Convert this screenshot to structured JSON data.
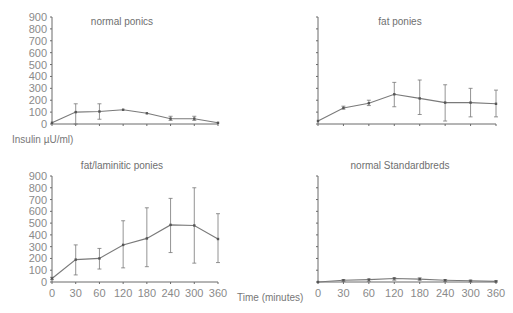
{
  "figure": {
    "ylabel": "Insulin µU/ml)",
    "xlabel": "Time (minutes)"
  },
  "chart_data": [
    {
      "type": "line",
      "title": "normal ponics",
      "categories": [
        "0",
        "30",
        "60",
        "120",
        "180",
        "240",
        "300",
        "360"
      ],
      "values": [
        10,
        100,
        105,
        120,
        90,
        45,
        45,
        10
      ],
      "error_low": [
        10,
        0,
        40,
        120,
        90,
        30,
        30,
        10
      ],
      "error_high": [
        10,
        170,
        170,
        120,
        90,
        65,
        65,
        10
      ],
      "ylim": [
        0,
        900
      ],
      "yticks": [
        "0",
        "100",
        "200",
        "300",
        "400",
        "500",
        "600",
        "700",
        "800",
        "900"
      ],
      "show_ytick_labels": true,
      "show_xtick_labels": false
    },
    {
      "type": "line",
      "title": "fat ponies",
      "categories": [
        "0",
        "30",
        "60",
        "120",
        "180",
        "240",
        "300",
        "360"
      ],
      "values": [
        25,
        135,
        175,
        250,
        215,
        180,
        180,
        170
      ],
      "error_low": [
        25,
        125,
        155,
        145,
        80,
        25,
        60,
        60
      ],
      "error_high": [
        25,
        150,
        200,
        350,
        370,
        330,
        300,
        285
      ],
      "ylim": [
        0,
        900
      ],
      "yticks": [
        "0",
        "100",
        "200",
        "300",
        "400",
        "500",
        "600",
        "700",
        "800",
        "900"
      ],
      "show_ytick_labels": false,
      "show_xtick_labels": false
    },
    {
      "type": "line",
      "title": "fat/laminitic ponies",
      "categories": [
        "0",
        "30",
        "60",
        "120",
        "180",
        "240",
        "300",
        "360"
      ],
      "values": [
        30,
        190,
        200,
        315,
        370,
        485,
        480,
        365
      ],
      "error_low": [
        20,
        60,
        110,
        120,
        130,
        250,
        160,
        165
      ],
      "error_high": [
        40,
        315,
        285,
        520,
        630,
        710,
        800,
        580
      ],
      "ylim": [
        0,
        900
      ],
      "yticks": [
        "0",
        "100",
        "200",
        "300",
        "400",
        "500",
        "600",
        "700",
        "800",
        "900"
      ],
      "show_ytick_labels": true,
      "show_xtick_labels": true
    },
    {
      "type": "line",
      "title": "normal Standardbreds",
      "categories": [
        "0",
        "30",
        "60",
        "120",
        "180",
        "240",
        "300",
        "360"
      ],
      "values": [
        0,
        15,
        20,
        30,
        25,
        15,
        10,
        5
      ],
      "error_low": [
        0,
        5,
        5,
        15,
        15,
        5,
        0,
        0
      ],
      "error_high": [
        0,
        20,
        25,
        35,
        35,
        20,
        15,
        10
      ],
      "ylim": [
        0,
        900
      ],
      "yticks": [
        "0",
        "100",
        "200",
        "300",
        "400",
        "500",
        "600",
        "700",
        "800",
        "900"
      ],
      "show_ytick_labels": false,
      "show_xtick_labels": true
    }
  ]
}
